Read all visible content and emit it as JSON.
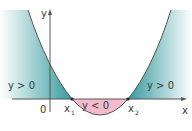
{
  "diagram": {
    "type": "parabola-sign-diagram",
    "axes": {
      "x_label": "x",
      "y_label": "y",
      "origin_label": "0"
    },
    "roots": [
      {
        "label": "x",
        "subscript": "1"
      },
      {
        "label": "x",
        "subscript": "2"
      }
    ],
    "regions": [
      {
        "id": "left-positive",
        "label": "y > 0",
        "color": "#2a9a9e"
      },
      {
        "id": "middle-negative",
        "label": "y < 0",
        "color": "#f2b8c8"
      },
      {
        "id": "right-positive",
        "label": "y > 0",
        "color": "#2a9a9e"
      }
    ],
    "colors": {
      "curve": "#555555",
      "axis": "#555555",
      "positive_fill": "#2a9a9e",
      "negative_fill": "#f2b8c8"
    }
  }
}
